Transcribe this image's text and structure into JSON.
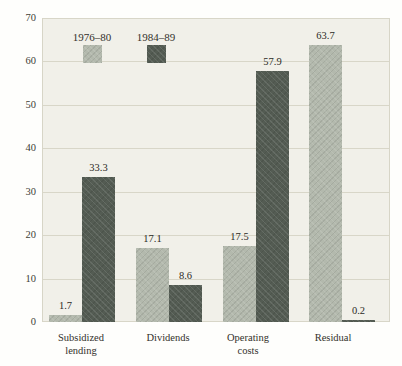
{
  "chart_data": {
    "type": "bar",
    "title": "",
    "categories": [
      "Subsidized lending",
      "Dividends",
      "Operating costs",
      "Residual"
    ],
    "category_label_lines": [
      [
        "Subsidized",
        "lending"
      ],
      [
        "Dividends"
      ],
      [
        "Operating",
        "costs"
      ],
      [
        "Residual"
      ]
    ],
    "series": [
      {
        "name": "1976–80",
        "values": [
          1.7,
          17.1,
          17.5,
          63.7
        ],
        "labels": [
          "1.7",
          "17.1",
          "17.5",
          "63.7"
        ],
        "color": "#b3b9ad"
      },
      {
        "name": "1984–89",
        "values": [
          33.3,
          8.6,
          57.9,
          0.2
        ],
        "labels": [
          "33.3",
          "8.6",
          "57.9",
          "0.2"
        ],
        "color": "#545c53"
      }
    ],
    "xlabel": "",
    "ylabel": "",
    "ylim": [
      0,
      70
    ],
    "yticks": [
      0,
      10,
      20,
      30,
      40,
      50,
      60,
      70
    ],
    "ytick_labels": [
      "0",
      "10",
      "20",
      "30",
      "40",
      "50",
      "60",
      "70"
    ],
    "grid": "horizontal",
    "legend_position": "top-inside",
    "value_labels_shown": true
  },
  "colors": {
    "plot_background": "#f1f0e9",
    "gridline": "#b0aa92",
    "series_light": "#b3b9ad",
    "series_dark": "#545c53",
    "text": "#33312b"
  }
}
